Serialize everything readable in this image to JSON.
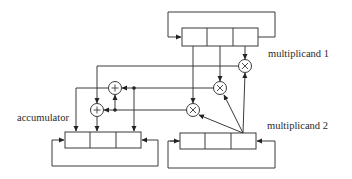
{
  "diagram": {
    "type": "block-diagram",
    "title": "",
    "labels": {
      "multiplicand1": "multiplicand 1",
      "multiplicand2": "multiplicand 2",
      "accumulator": "accumulator"
    },
    "registers": [
      {
        "id": "multiplicand-1",
        "label": "multiplicand 1",
        "cells": 3,
        "feedback_loop": true
      },
      {
        "id": "multiplicand-2",
        "label": "multiplicand 2",
        "cells": 3,
        "feedback_loop": true
      },
      {
        "id": "accumulator",
        "label": "accumulator",
        "cells": 3,
        "feedback_loop": true
      }
    ],
    "operators": [
      {
        "id": "mult-top",
        "symbol": "×",
        "kind": "multiplier"
      },
      {
        "id": "mult-middle",
        "symbol": "×",
        "kind": "multiplier"
      },
      {
        "id": "mult-bottom",
        "symbol": "×",
        "kind": "multiplier"
      },
      {
        "id": "adder-upper",
        "symbol": "+",
        "kind": "adder"
      },
      {
        "id": "adder-lower",
        "symbol": "+",
        "kind": "adder"
      }
    ],
    "connections": [
      {
        "from": "multiplicand-1.cell3",
        "to": "mult-top"
      },
      {
        "from": "multiplicand-1.cell2",
        "to": "mult-middle"
      },
      {
        "from": "multiplicand-1.cell1",
        "to": "mult-bottom"
      },
      {
        "from": "multiplicand-2.cell3",
        "to": "mult-top"
      },
      {
        "from": "multiplicand-2.cell3",
        "to": "mult-middle"
      },
      {
        "from": "multiplicand-2.cell3",
        "to": "mult-bottom"
      },
      {
        "from": "mult-top",
        "to": "adder-lower"
      },
      {
        "from": "mult-middle",
        "to": "adder-upper"
      },
      {
        "from": "mult-middle",
        "to": "accumulator.cell3"
      },
      {
        "from": "mult-bottom",
        "to": "adder-lower"
      },
      {
        "from": "mult-bottom",
        "to": "adder-upper"
      },
      {
        "from": "adder-upper",
        "to": "accumulator.cell1"
      },
      {
        "from": "adder-lower",
        "to": "accumulator.cell2"
      }
    ]
  }
}
